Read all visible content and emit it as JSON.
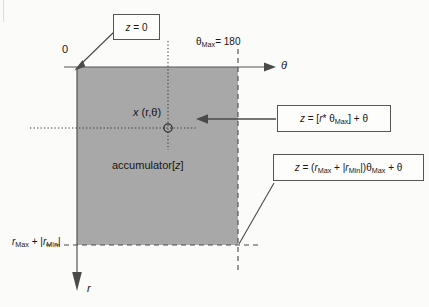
{
  "diagram": {
    "axes": {
      "origin_label": "0",
      "horizontal_axis_label": "θ",
      "vertical_axis_label": "r",
      "theta_max_tick": "θMax = 180",
      "theta_max_symbol": "θ",
      "theta_max_subscript": "Max",
      "theta_max_value": "= 180",
      "r_extent_label": "rMax + |rMin|",
      "r_extent_parts": {
        "r1": "r",
        "sub1": "Max",
        "plus": " + ",
        "bar_open": "|",
        "r2": "r",
        "sub2": "Min",
        "bar_close": "|"
      }
    },
    "point": {
      "label_x": "x",
      "label_coords": "(r,θ)"
    },
    "array": {
      "label": "accumulator[",
      "index": "z",
      "label_close": "]"
    },
    "callouts": [
      {
        "name": "z-zero",
        "text": "z = 0",
        "parts": {
          "z": "z",
          "eq": "= 0"
        }
      },
      {
        "name": "z-formula",
        "text": "z = [r* θMax] + θ",
        "parts": {
          "z": "z",
          "eq": " = [",
          "r": "r",
          "star": "*",
          "theta": " θ",
          "sub": "Max",
          "close": "] + ",
          "theta2": "θ"
        }
      },
      {
        "name": "z-max",
        "text": "z = (rMax + |rMin|)θMax + θ",
        "parts": {
          "z": "z",
          "eq": " = (",
          "r1": "r",
          "sub1": "Max",
          "plus": " + |",
          "r2": "r",
          "sub2": "Min",
          "bar": "|)",
          "theta": "θ",
          "sub3": "Max",
          "tail": " + ",
          "theta2": "θ"
        }
      }
    ],
    "colors": {
      "accumulator_fill": "#a8a8a8",
      "line": "#545454",
      "text": "#161616",
      "background": "#fbfbfa",
      "callout_border": "#555555"
    }
  }
}
